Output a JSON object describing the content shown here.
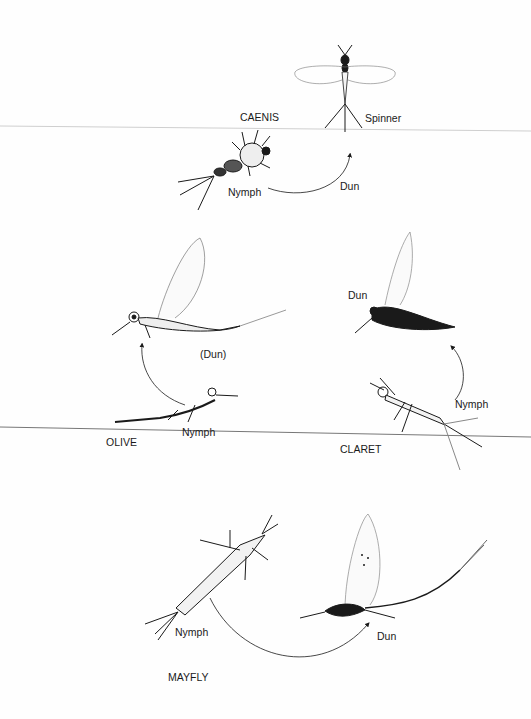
{
  "diagram": {
    "type": "life-cycle illustration",
    "colors": {
      "ink": "#1a1a1a",
      "divider_line": "#8a8a8a",
      "background": "#fefefe"
    },
    "panels": [
      {
        "name": "CAENIS",
        "title": "CAENIS",
        "stages": {
          "nymph": "Nymph",
          "dun": "Dun",
          "spinner": "Spinner"
        }
      },
      {
        "name": "OLIVE",
        "title": "OLIVE",
        "stages": {
          "dun": "(Dun)",
          "nymph": "Nymph"
        }
      },
      {
        "name": "CLARET",
        "title": "CLARET",
        "stages": {
          "dun": "Dun",
          "nymph": "Nymph"
        }
      },
      {
        "name": "MAYFLY",
        "title": "MAYFLY",
        "stages": {
          "nymph": "Nymph",
          "dun": "Dun"
        }
      }
    ]
  }
}
